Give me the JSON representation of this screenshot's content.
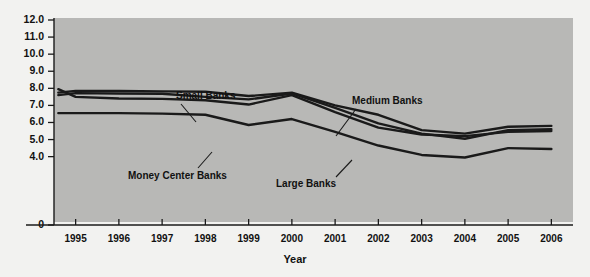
{
  "chart_data": {
    "type": "line",
    "title": "",
    "xlabel": "Year",
    "ylabel": "Gross Interest Income (as % of Assets)",
    "xlim": [
      1994.5,
      2006.5
    ],
    "ylim": [
      0,
      12
    ],
    "grid": false,
    "legend_position": "inline-annotations",
    "x": [
      1994.6,
      1995,
      1996,
      1997,
      1998,
      1999,
      2000,
      2001,
      2002,
      2003,
      2004,
      2005,
      2006
    ],
    "ytick_labels": [
      "12.0",
      "11.0",
      "10.0",
      "9.0",
      "8.0",
      "7.0",
      "6.0",
      "5.0",
      "4.0",
      "0"
    ],
    "ytick_values": [
      12.0,
      11.0,
      10.0,
      9.0,
      8.0,
      7.0,
      6.0,
      5.0,
      4.0,
      0
    ],
    "xtick_labels": [
      "1995",
      "1996",
      "1997",
      "1998",
      "1999",
      "2000",
      "2001",
      "2002",
      "2003",
      "2004",
      "2005",
      "2006"
    ],
    "xtick_values": [
      1995,
      1996,
      1997,
      1998,
      1999,
      2000,
      2001,
      2002,
      2003,
      2004,
      2005,
      2006
    ],
    "series": [
      {
        "name": "Small Banks",
        "color": "#1a1a1a",
        "values": [
          7.75,
          7.85,
          7.85,
          7.82,
          7.8,
          7.55,
          7.75,
          7.0,
          6.45,
          5.55,
          5.35,
          5.75,
          5.8
        ]
      },
      {
        "name": "Medium Banks",
        "color": "#1a1a1a",
        "values": [
          7.6,
          7.72,
          7.7,
          7.68,
          7.5,
          7.35,
          7.7,
          6.85,
          5.95,
          5.35,
          5.05,
          5.55,
          5.6
        ]
      },
      {
        "name": "Large Banks",
        "color": "#1a1a1a",
        "values": [
          7.95,
          7.5,
          7.4,
          7.38,
          7.3,
          7.05,
          7.6,
          6.6,
          5.7,
          5.3,
          5.2,
          5.45,
          5.5
        ]
      },
      {
        "name": "Money Center Banks",
        "color": "#1a1a1a",
        "values": [
          6.55,
          6.55,
          6.55,
          6.52,
          6.45,
          5.85,
          6.2,
          5.45,
          4.65,
          4.1,
          3.95,
          4.5,
          4.45
        ]
      }
    ],
    "annotations": [
      {
        "label": "Small Banks",
        "x": 176,
        "y": 90,
        "leader": [
          [
            181,
            104
          ],
          [
            196,
            122
          ]
        ]
      },
      {
        "label": "Medium Banks",
        "x": 352,
        "y": 95,
        "leader": [
          [
            356,
            109
          ],
          [
            336,
            136
          ]
        ]
      },
      {
        "label": "Money Center Banks",
        "x": 128,
        "y": 170,
        "leader": [
          [
            198,
            168
          ],
          [
            212,
            152
          ]
        ]
      },
      {
        "label": "Large Banks",
        "x": 276,
        "y": 178,
        "leader": [
          [
            336,
            177
          ],
          [
            352,
            160
          ]
        ]
      }
    ]
  },
  "figure": {
    "plot_background": "#b8b8b6",
    "page_background": "#f2f2f0",
    "axis_color": "#1a1a1a"
  }
}
